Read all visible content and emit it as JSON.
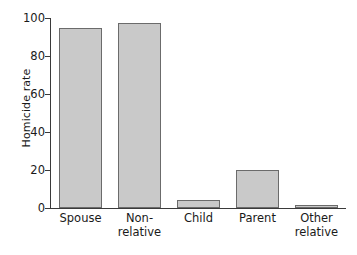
{
  "chart_data": {
    "type": "bar",
    "title": "",
    "xlabel": "",
    "ylabel": "Homicide rate",
    "categories": [
      "Spouse",
      "Non-relative",
      "Child",
      "Parent",
      "Other relative"
    ],
    "category_lines": [
      [
        "Spouse"
      ],
      [
        "Non-",
        "relative"
      ],
      [
        "Child"
      ],
      [
        "Parent"
      ],
      [
        "Other",
        "relative"
      ]
    ],
    "values": [
      95,
      97.5,
      4,
      20,
      1.5
    ],
    "ylim": [
      0,
      100
    ],
    "yticks": [
      0,
      20,
      40,
      60,
      80,
      100
    ],
    "ytick_labels": [
      "0",
      "20",
      "40",
      "60",
      "80",
      "100"
    ],
    "grid": false,
    "legend": null,
    "bar_fill_color": "#c9c9c9",
    "bar_edge_color": "#6b6b6b",
    "axis_color": "#3a3a3a",
    "text_color": "#1a1a1a",
    "background_color": "#ffffff"
  }
}
